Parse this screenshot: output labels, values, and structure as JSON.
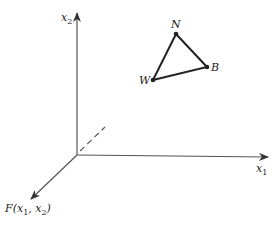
{
  "diagram": {
    "axes": {
      "x2": {
        "label": "x",
        "sub": "2"
      },
      "x1": {
        "label": "x",
        "sub": "1"
      },
      "f": {
        "label_prefix": "F(x",
        "sub1": "1",
        "mid": ", x",
        "sub2": "2",
        "suffix": ")"
      }
    },
    "points": [
      {
        "id": "N",
        "label": "N",
        "x": 176,
        "y": 34
      },
      {
        "id": "B",
        "label": "B",
        "x": 207,
        "y": 67
      },
      {
        "id": "W",
        "label": "W",
        "x": 153,
        "y": 80
      }
    ],
    "colors": {
      "stroke": "#3a3a3a",
      "text": "#222222"
    }
  }
}
